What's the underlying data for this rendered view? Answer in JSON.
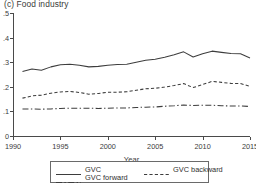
{
  "panel": {
    "title": "(c) Food industry"
  },
  "axes": {
    "xlabel": "Year",
    "ylabel": "",
    "xticks": [
      "1990",
      "1995",
      "2000",
      "2005",
      "2010",
      "2015"
    ],
    "yticks": [
      "0",
      ".1",
      ".2",
      ".3",
      ".4",
      ".5"
    ],
    "xlim": [
      1990,
      2015
    ],
    "ylim": [
      0,
      0.5
    ],
    "grid": false
  },
  "legend": {
    "position": "bottom-outside",
    "entries": [
      {
        "label": "GVC",
        "style": "solid",
        "icon": "solid-line-icon"
      },
      {
        "label": "GVC backward",
        "style": "dashed",
        "icon": "dashed-line-icon"
      },
      {
        "label": "GVC forward",
        "style": "dash-dot",
        "icon": "dash-dot-line-icon"
      }
    ]
  },
  "chart_data": {
    "type": "line",
    "title": "(c) Food industry",
    "xlabel": "Year",
    "ylabel": "",
    "xlim": [
      1990,
      2015
    ],
    "ylim": [
      0,
      0.5
    ],
    "grid": false,
    "legend_position": "bottom-outside",
    "x": [
      1991,
      1992,
      1993,
      1994,
      1995,
      1996,
      1997,
      1998,
      1999,
      2000,
      2001,
      2002,
      2003,
      2004,
      2005,
      2006,
      2007,
      2008,
      2009,
      2010,
      2011,
      2012,
      2013,
      2014,
      2015
    ],
    "series": [
      {
        "name": "GVC",
        "style": "solid",
        "values": [
          0.262,
          0.272,
          0.267,
          0.281,
          0.29,
          0.292,
          0.288,
          0.281,
          0.283,
          0.288,
          0.291,
          0.292,
          0.3,
          0.308,
          0.312,
          0.32,
          0.33,
          0.342,
          0.321,
          0.334,
          0.345,
          0.34,
          0.335,
          0.334,
          0.317
        ]
      },
      {
        "name": "GVC backward",
        "style": "dashed",
        "values": [
          0.154,
          0.163,
          0.166,
          0.174,
          0.179,
          0.181,
          0.177,
          0.17,
          0.173,
          0.178,
          0.178,
          0.18,
          0.186,
          0.192,
          0.194,
          0.199,
          0.205,
          0.213,
          0.197,
          0.209,
          0.222,
          0.218,
          0.214,
          0.213,
          0.202
        ]
      },
      {
        "name": "GVC forward",
        "style": "dash-dot",
        "values": [
          0.11,
          0.11,
          0.109,
          0.11,
          0.112,
          0.113,
          0.113,
          0.113,
          0.112,
          0.113,
          0.114,
          0.114,
          0.116,
          0.117,
          0.118,
          0.121,
          0.123,
          0.126,
          0.124,
          0.125,
          0.125,
          0.123,
          0.122,
          0.122,
          0.12
        ]
      }
    ]
  }
}
